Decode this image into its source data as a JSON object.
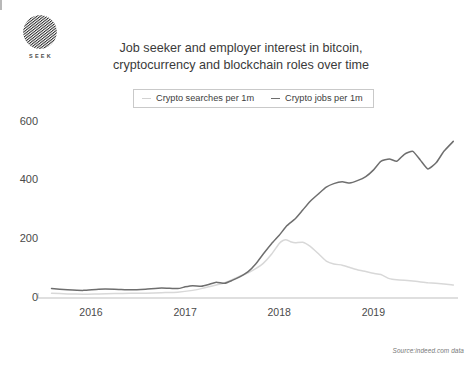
{
  "brand": {
    "name": "SEEK",
    "logo_icon": "seek-striped-circle-logo"
  },
  "title": {
    "line1": "Job seeker and employer interest in bitcoin,",
    "line2": "cryptocurrency and blockchain roles over time"
  },
  "source": "Source:indeed.com data",
  "colors": {
    "searches_line": "#d8d8d8",
    "jobs_line": "#6e6e6e",
    "axis": "#c0c0c0",
    "text": "#4a4a4a",
    "legend_border": "#c9c9c9"
  },
  "chart_data": {
    "type": "line",
    "title": "Job seeker and employer interest in bitcoin, cryptocurrency and blockchain roles over time",
    "xlabel": "",
    "ylabel": "",
    "xlim": [
      2015.5,
      2019.9
    ],
    "ylim": [
      0,
      640
    ],
    "yticks": [
      0,
      200,
      400,
      600
    ],
    "xticks": [
      2016,
      2017,
      2018,
      2019
    ],
    "xtick_labels": [
      "2016",
      "2017",
      "2018",
      "2019"
    ],
    "ytick_labels": [
      "0",
      "200",
      "400",
      "600"
    ],
    "grid": false,
    "legend_position": "top-center",
    "series": [
      {
        "name": "Crypto searches per 1m",
        "color": "#d8d8d8",
        "x": [
          2015.58,
          2015.75,
          2015.92,
          2016.08,
          2016.25,
          2016.42,
          2016.58,
          2016.75,
          2016.92,
          2017.08,
          2017.17,
          2017.25,
          2017.33,
          2017.42,
          2017.5,
          2017.58,
          2017.67,
          2017.75,
          2017.83,
          2017.92,
          2018.0,
          2018.04,
          2018.08,
          2018.12,
          2018.17,
          2018.25,
          2018.33,
          2018.42,
          2018.5,
          2018.58,
          2018.67,
          2018.75,
          2018.83,
          2018.92,
          2019.0,
          2019.08,
          2019.17,
          2019.25,
          2019.42,
          2019.58,
          2019.75,
          2019.85
        ],
        "values": [
          16,
          14,
          13,
          14,
          15,
          16,
          16,
          18,
          20,
          26,
          32,
          38,
          44,
          52,
          62,
          74,
          86,
          100,
          118,
          150,
          186,
          196,
          198,
          192,
          188,
          190,
          176,
          150,
          126,
          116,
          112,
          104,
          96,
          90,
          84,
          80,
          66,
          62,
          58,
          52,
          48,
          44
        ]
      },
      {
        "name": "Crypto jobs per 1m",
        "color": "#6e6e6e",
        "x": [
          2015.58,
          2015.75,
          2015.92,
          2016.08,
          2016.25,
          2016.42,
          2016.58,
          2016.75,
          2016.92,
          2017.0,
          2017.08,
          2017.17,
          2017.25,
          2017.33,
          2017.42,
          2017.5,
          2017.58,
          2017.67,
          2017.75,
          2017.83,
          2017.92,
          2018.0,
          2018.08,
          2018.17,
          2018.25,
          2018.33,
          2018.42,
          2018.5,
          2018.58,
          2018.67,
          2018.75,
          2018.83,
          2018.92,
          2019.0,
          2019.08,
          2019.17,
          2019.25,
          2019.33,
          2019.42,
          2019.5,
          2019.58,
          2019.67,
          2019.75,
          2019.85
        ],
        "values": [
          32,
          28,
          26,
          30,
          30,
          28,
          30,
          34,
          32,
          38,
          42,
          40,
          46,
          54,
          50,
          60,
          72,
          90,
          116,
          150,
          186,
          214,
          246,
          270,
          300,
          330,
          356,
          378,
          390,
          396,
          392,
          400,
          414,
          436,
          466,
          474,
          466,
          490,
          500,
          470,
          440,
          462,
          500,
          534
        ]
      }
    ]
  }
}
